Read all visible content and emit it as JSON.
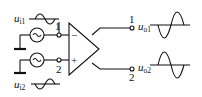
{
  "diagram": {
    "type": "differential amplifier circuit",
    "inputs": [
      {
        "label": "u",
        "sub": "i1",
        "terminal": "1",
        "polarity": "−"
      },
      {
        "label": "u",
        "sub": "i2",
        "terminal": "2",
        "polarity": "+"
      }
    ],
    "outputs": [
      {
        "label": "u",
        "sub": "o1",
        "terminal": "1"
      },
      {
        "label": "u",
        "sub": "o2",
        "terminal": "2"
      }
    ],
    "source_symbol": "~",
    "colors": {
      "line": "#111111",
      "background": "#ffffff"
    }
  }
}
